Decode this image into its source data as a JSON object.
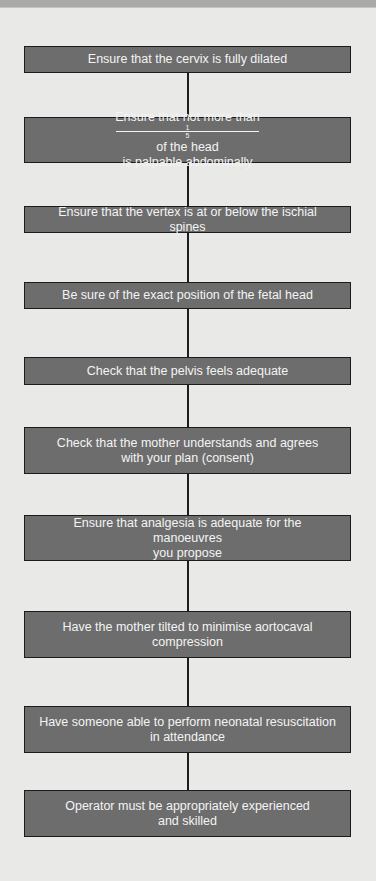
{
  "diagram": {
    "type": "vertical-flowchart",
    "colors": {
      "background": "#e9e9e8",
      "box_fill": "#6d6d6d",
      "box_border": "#1c1c1c",
      "box_text": "#f4f4f4",
      "connector": "#1e1e1e"
    },
    "steps": [
      {
        "line1": "Ensure that the cervix is fully dilated",
        "line2": ""
      },
      {
        "line1_pre": "Ensure that not more than",
        "fraction_num": "1",
        "fraction_den": "5",
        "line1_post": "of the head",
        "line2": "is palpable abdominally"
      },
      {
        "line1": "Ensure that the vertex is at or below the ischial spines",
        "line2": ""
      },
      {
        "line1": "Be sure of the exact position of the fetal head",
        "line2": ""
      },
      {
        "line1": "Check that the pelvis feels adequate",
        "line2": ""
      },
      {
        "line1": "Check that the mother understands and agrees",
        "line2": "with your plan (consent)"
      },
      {
        "line1": "Ensure that analgesia is adequate for the manoeuvres",
        "line2": "you propose"
      },
      {
        "line1": "Have the mother tilted to minimise aortocaval",
        "line2": "compression"
      },
      {
        "line1": "Have someone able to perform neonatal resuscitation",
        "line2": "in attendance"
      },
      {
        "line1": "Operator must be appropriately experienced",
        "line2": "and skilled"
      }
    ]
  }
}
